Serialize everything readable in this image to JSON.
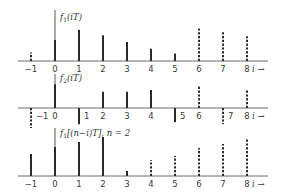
{
  "figure": {
    "axis_variable": "i",
    "arrow": "→",
    "tick_labels": [
      "−1",
      "0",
      "1",
      "2",
      "3",
      "4",
      "5",
      "6",
      "7",
      "8"
    ]
  },
  "panels": [
    {
      "id": "f1",
      "label_main": "f",
      "label_sub": "1",
      "label_arg": "(iT)",
      "label_suffix": ""
    },
    {
      "id": "f2",
      "label_main": "f",
      "label_sub": "2",
      "label_arg": "(iT)",
      "label_suffix": ""
    },
    {
      "id": "f1-shifted",
      "label_main": "f",
      "label_sub": "1",
      "label_arg": "[(n−i)T]",
      "label_suffix": ", n = 2"
    }
  ],
  "chart_data": [
    {
      "type": "stem",
      "title": "f1(iT)",
      "xlabel": "i",
      "x": [
        -1,
        0,
        1,
        2,
        3,
        4,
        5,
        6,
        7,
        8
      ],
      "values": [
        0.9,
        2.2,
        3.3,
        2.7,
        2.0,
        1.3,
        0.8,
        3.6,
        3.2,
        2.6
      ],
      "style": [
        "dashed",
        "solid",
        "solid",
        "solid",
        "solid",
        "solid",
        "solid",
        "dashed",
        "dashed",
        "dashed"
      ]
    },
    {
      "type": "stem",
      "title": "f2(iT)",
      "xlabel": "i",
      "x": [
        -1,
        0,
        1,
        2,
        3,
        4,
        5,
        6,
        7,
        8
      ],
      "values": [
        -2.1,
        2.5,
        -1.7,
        1.7,
        1.7,
        1.9,
        -1.5,
        2.3,
        -1.7,
        1.9
      ],
      "style": [
        "dashed",
        "solid",
        "solid",
        "solid",
        "solid",
        "solid",
        "solid",
        "dashed",
        "dashed",
        "dashed"
      ]
    },
    {
      "type": "stem",
      "title": "f1[(n−i)T], n = 2",
      "xlabel": "i",
      "x": [
        -1,
        0,
        1,
        2,
        3,
        4,
        5,
        6,
        7,
        8
      ],
      "values": [
        2.2,
        2.9,
        3.4,
        3.9,
        0.5,
        1.6,
        2.0,
        2.8,
        3.2,
        3.8
      ],
      "style": [
        "solid",
        "solid",
        "solid",
        "solid",
        "solid",
        "dashed",
        "dashed",
        "dashed",
        "dashed",
        "dashed"
      ]
    }
  ]
}
